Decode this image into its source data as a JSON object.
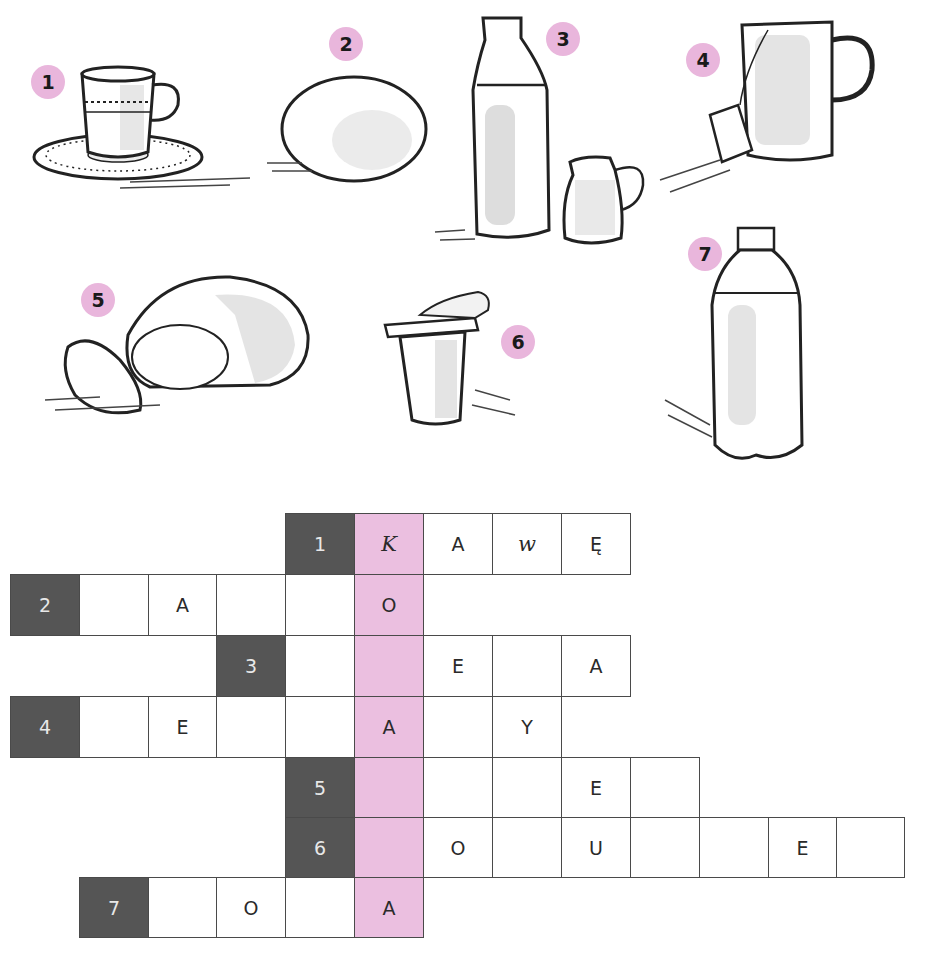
{
  "exercise": {
    "clipped_heading": "",
    "pictures": [
      {
        "number": "1",
        "subject": "coffee cup on saucer"
      },
      {
        "number": "2",
        "subject": "egg"
      },
      {
        "number": "3",
        "subject": "milk bottle and jug"
      },
      {
        "number": "4",
        "subject": "mug with tea bag"
      },
      {
        "number": "5",
        "subject": "loaf of bread"
      },
      {
        "number": "6",
        "subject": "yogurt cup"
      },
      {
        "number": "7",
        "subject": "bottle of water"
      }
    ],
    "colors": {
      "highlight_column": "#ebbfe0",
      "clue_cell": "#555555",
      "badge": "#e9b6dc"
    }
  },
  "crossword": {
    "rows": [
      {
        "clue": "1",
        "cells": [
          "K",
          "A",
          "w",
          "Ę"
        ]
      },
      {
        "clue": "2",
        "cells": [
          "",
          "A",
          "",
          "",
          "O"
        ]
      },
      {
        "clue": "3",
        "cells": [
          "",
          "",
          "E",
          "",
          "A"
        ]
      },
      {
        "clue": "4",
        "cells": [
          "",
          "E",
          "",
          "",
          "A",
          "",
          "Y"
        ]
      },
      {
        "clue": "5",
        "cells": [
          "",
          "",
          "",
          "E",
          ""
        ]
      },
      {
        "clue": "6",
        "cells": [
          "",
          "O",
          "",
          "U",
          "",
          "",
          "E",
          ""
        ]
      },
      {
        "clue": "7",
        "cells": [
          "",
          "O",
          "",
          "A"
        ]
      }
    ]
  }
}
